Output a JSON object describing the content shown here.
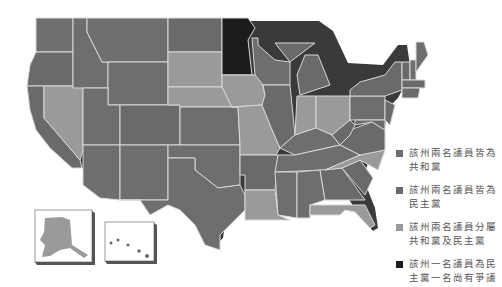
{
  "map": {
    "title": "",
    "colors": {
      "republican": "#6e6e6e",
      "democrat": "#6a6a6a",
      "split": "#9a9a9a",
      "disputed": "#1c1c1c",
      "border": "#d8d8d8",
      "shadow": "#3a3a3a"
    },
    "insets": [
      {
        "name": "alaska",
        "fill": "split"
      },
      {
        "name": "hawaii",
        "fill": "democrat"
      }
    ]
  },
  "legend": {
    "items": [
      {
        "label": "該州兩名議員皆為共和黨",
        "line1": "該州兩名議員皆為",
        "line2": "共和黨",
        "color": "#6e6e6e"
      },
      {
        "label": "該州兩名議員皆為民主黨",
        "line1": "該州兩名議員皆為",
        "line2": "民主黨",
        "color": "#6a6a6a"
      },
      {
        "label": "該州兩名議員分屬共和黨及民主黨",
        "line1": "該州兩名議員分屬",
        "line2": "共和黨及民主黨",
        "color": "#9a9a9a"
      },
      {
        "label": "該州一名議員為民主黨一名尚有爭議",
        "line1": "該州一名議員為民",
        "line2": "主黨一名尚有爭議",
        "color": "#1c1c1c"
      }
    ]
  }
}
